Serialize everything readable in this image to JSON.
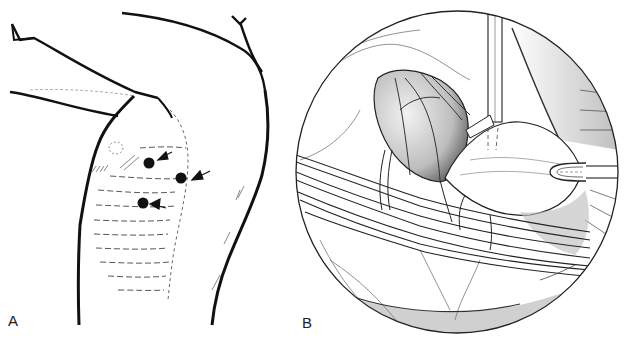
{
  "figure": {
    "panels": [
      {
        "id": "A",
        "label": "A",
        "subject": "lateral chest wall with arm raised",
        "markers": [
          {
            "type": "port-site-dot",
            "x": 149,
            "y": 163
          },
          {
            "type": "port-site-dot",
            "x": 181,
            "y": 178
          },
          {
            "type": "port-site-dot",
            "x": 143,
            "y": 203
          }
        ],
        "arrows": 3
      },
      {
        "id": "B",
        "label": "B",
        "subject": "circular endoscopic (thoracoscopic) view with instruments",
        "view_circle": {
          "cx": 457,
          "cy": 172,
          "r": 161
        }
      }
    ],
    "colors": {
      "ink": "#111111",
      "background": "#ffffff",
      "shading": "#777777"
    }
  }
}
